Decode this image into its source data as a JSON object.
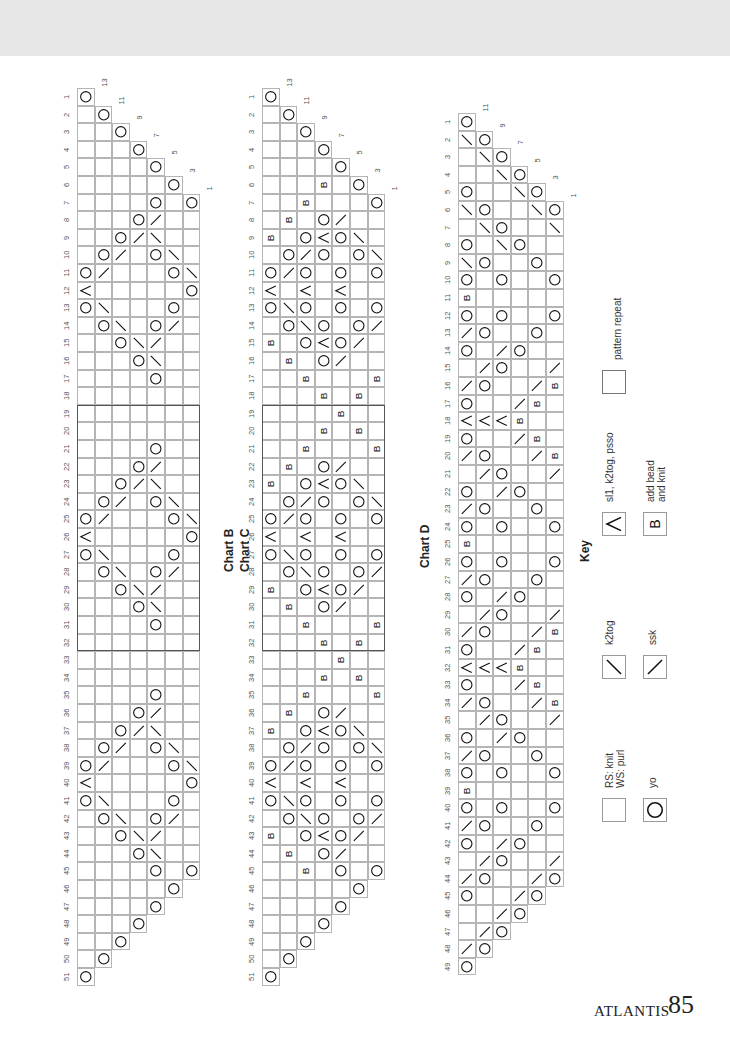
{
  "page": {
    "footer_name": "ATLANTIS",
    "footer_page": "85"
  },
  "legend_symbols": {
    ".": "knit",
    "O": "yo",
    "/": "k2tog",
    "\\": "ssk",
    "^": "sl1-k2tog-psso",
    "B": "add-bead"
  },
  "charts": [
    {
      "id": "B",
      "title": "Chart B",
      "x": 77,
      "y": 88,
      "title_x": 222,
      "title_y": 572,
      "stitch_labels": {
        "1": "13",
        "2": "11",
        "3": "9",
        "4": "7",
        "5": "5",
        "6": "3",
        "7": "1"
      },
      "repeat": {
        "from_row": 19,
        "to_row": 32
      },
      "rows": [
        "O",
        ".O",
        "..O",
        "...O",
        "....O",
        ".....O",
        "....O.O",
        "...O/..",
        "..O/\\..",
        ".O/.O\\.",
        "O/...O\\",
        "^.....O",
        "O\\...O.",
        ".O\\.O/.",
        "..O\\/..",
        "...O\\..",
        "....O..",
        ".......",
        ".......",
        ".......",
        "....O..",
        "...O/..",
        "..O/\\..",
        ".O/.O\\.",
        "O/...O\\",
        "^.....O",
        "O\\...O.",
        ".O\\.O/.",
        "..O\\/..",
        "...O\\..",
        "....O..",
        ".......",
        ".......",
        ".......",
        "....O..",
        "...O/..",
        "..O/\\..",
        ".O/.O\\.",
        "O/...O\\",
        "^.....O",
        "O\\...O.",
        ".O\\.O/.",
        "..O\\/..",
        "...O\\..",
        "....O.O",
        ".....O",
        "....O",
        "...O",
        "..O",
        ".O",
        "O"
      ]
    },
    {
      "id": "C",
      "title": "Chart C",
      "x": 262,
      "y": 88,
      "title_x": 238,
      "title_y": 572,
      "stitch_labels": {
        "1": "13",
        "2": "11",
        "3": "9",
        "4": "7",
        "5": "5",
        "6": "3",
        "7": "1"
      },
      "repeat": {
        "from_row": 19,
        "to_row": 32
      },
      "rows": [
        "O",
        ".O",
        "..O",
        "...O",
        "....O",
        "...B.O",
        "..B...O",
        ".B.O/..",
        "B.O^O\\.",
        ".O/O.O\\",
        "O/O.O.O",
        "^.^.^..",
        "O\\O.O.O",
        ".O\\O.O/",
        "B.O^O/.",
        ".B.O/..",
        "..B...B",
        "...B.B.",
        "....B..",
        "...B.B.",
        "..B...B",
        ".B.O/..",
        "B.O^O\\.",
        ".O/O.O\\",
        "O/O.O.O",
        "^.^.^..",
        "O\\O.O.O",
        ".O\\O.O/",
        "B.O^O/.",
        ".B.O/..",
        "..B...B",
        "...B.B.",
        "....B..",
        "...B.B.",
        "..B...B",
        ".B.O/..",
        "B.O^O\\.",
        ".O/O.O\\",
        "O/O.O.O",
        "^.^.^..",
        "O\\O.O.O",
        ".O\\O.O/",
        "B.O^O/.",
        ".B.O/..",
        "..B.O.O",
        ".....O",
        "....O",
        "...O",
        "..O",
        ".O",
        "O"
      ]
    },
    {
      "id": "D",
      "title": "Chart D",
      "x": 458,
      "y": 113,
      "title_x": 418,
      "title_y": 568,
      "stitch_labels": {
        "1": "11",
        "2": "9",
        "3": "7",
        "4": "5",
        "5": "3",
        "6": "1"
      },
      "repeat": null,
      "rows": [
        "O",
        "\\O",
        ".\\O",
        "..\\O",
        "O..\\O",
        "\\O..\\O",
        ".\\O..\\",
        "O.\\O..",
        "\\O..O.",
        "O.O..O",
        "B.....",
        "O.O..O",
        "/O..O.",
        "O./O..",
        "./O../",
        "/O../B",
        "O../B.",
        "^^^B..",
        "O../B.",
        "/O../B",
        "./O../",
        "O./O..",
        "/O..O.",
        "O.O..O",
        "B.....",
        "O.O..O",
        "/O..O.",
        "O./O..",
        "./O../",
        "/O../B",
        "O../B.",
        "^^^B..",
        "O../B.",
        "/O../B",
        "./O../",
        "O./O..",
        "/O..O.",
        "O.O..O",
        "B.....",
        "O.O..O",
        "/O..O.",
        "O./O..",
        "./O../",
        "/O../O",
        "O../O",
        "../O",
        "./O",
        "/O",
        "O"
      ]
    }
  ],
  "key": {
    "title": "Key",
    "items": [
      {
        "symbol": ".",
        "label": "RS: knit\nWS: purl"
      },
      {
        "symbol": "O",
        "label": "yo"
      },
      {
        "symbol": "\\",
        "label": "k2tog"
      },
      {
        "symbol": "/",
        "label": "ssk"
      },
      {
        "symbol": "^",
        "label": "sl1, k2tog, psso"
      },
      {
        "symbol": "B",
        "label": "add bead\nand knit"
      },
      {
        "symbol": "R",
        "label": "pattern repeat"
      }
    ]
  }
}
